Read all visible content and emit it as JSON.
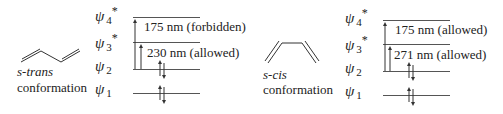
{
  "left_panel": {
    "conformation_name": "s-trans",
    "conformation_word": "conformation",
    "orbitals": [
      {
        "symbol": "ψ",
        "index": "4",
        "star": "*"
      },
      {
        "symbol": "ψ",
        "index": "3",
        "star": "*"
      },
      {
        "symbol": "ψ",
        "index": "2",
        "star": ""
      },
      {
        "symbol": "ψ",
        "index": "1",
        "star": ""
      }
    ],
    "transitions": [
      {
        "label": "175 nm (forbidden)",
        "from": "ψ2",
        "to": "ψ4*"
      },
      {
        "label": "230 nm (allowed)",
        "from": "ψ2",
        "to": "ψ3*"
      }
    ]
  },
  "right_panel": {
    "conformation_name": "s-cis",
    "conformation_word": "conformation",
    "orbitals": [
      {
        "symbol": "ψ",
        "index": "4",
        "star": "*"
      },
      {
        "symbol": "ψ",
        "index": "3",
        "star": "*"
      },
      {
        "symbol": "ψ",
        "index": "2",
        "star": ""
      },
      {
        "symbol": "ψ",
        "index": "1",
        "star": ""
      }
    ],
    "transitions": [
      {
        "label": "175 nm (allowed)",
        "from": "ψ2",
        "to": "ψ4*"
      },
      {
        "label": "271 nm (allowed)",
        "from": "ψ2",
        "to": "ψ3*"
      }
    ]
  },
  "colors": {
    "line": "#444444",
    "text": "#222222"
  }
}
